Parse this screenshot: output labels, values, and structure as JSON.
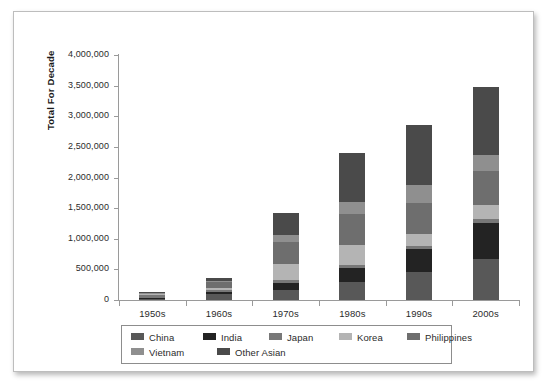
{
  "chart_data": {
    "type": "bar",
    "subtype": "stacked-vertical",
    "title": "",
    "xlabel": "",
    "ylabel": "Total For Decade",
    "categories": [
      "1950s",
      "1960s",
      "1970s",
      "1980s",
      "1990s",
      "2000s"
    ],
    "ylim": [
      0,
      4000000
    ],
    "ytick_values": [
      0,
      500000,
      1000000,
      1500000,
      2000000,
      2500000,
      3000000,
      3500000,
      4000000
    ],
    "ytick_labels": [
      "0",
      "500,000",
      "1,000,000",
      "1,500,000",
      "2,000,000",
      "2,500,000",
      "3,000,000",
      "3,500,000",
      "4,000,000"
    ],
    "grid": false,
    "legend_position": "bottom",
    "series": [
      {
        "name": "China",
        "color": "#585858",
        "values": [
          30000,
          100000,
          170000,
          300000,
          460000,
          670000
        ]
      },
      {
        "name": "India",
        "color": "#232323",
        "values": [
          10000,
          25000,
          105000,
          220000,
          365000,
          580000
        ]
      },
      {
        "name": "Japan",
        "color": "#787878",
        "values": [
          45000,
          40000,
          50000,
          50000,
          65000,
          70000
        ]
      },
      {
        "name": "Korea",
        "color": "#b4b4b4",
        "values": [
          10000,
          35000,
          270000,
          330000,
          180000,
          230000
        ]
      },
      {
        "name": "Philippines",
        "color": "#6e6e6e",
        "values": [
          20000,
          100000,
          360000,
          500000,
          510000,
          550000
        ]
      },
      {
        "name": "Vietnam",
        "color": "#8f8f8f",
        "values": [
          5000,
          5000,
          100000,
          200000,
          290000,
          270000
        ]
      },
      {
        "name": "Other Asian",
        "color": "#4a4a4a",
        "values": [
          10000,
          55000,
          365000,
          795000,
          990000,
          1100000
        ]
      }
    ],
    "totals": [
      130000,
      360000,
      1420000,
      2395000,
      2860000,
      3470000
    ]
  },
  "legend": {
    "rows": [
      [
        "China",
        "India",
        "Japan",
        "Korea",
        "Philippines"
      ],
      [
        "Vietnam",
        "Other Asian"
      ]
    ]
  }
}
